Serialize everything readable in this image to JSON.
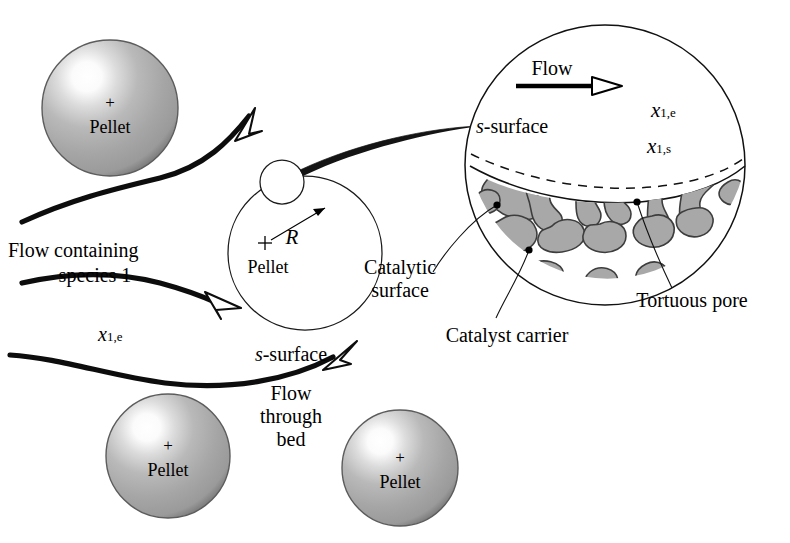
{
  "figure": {
    "type": "schematic-diagram",
    "background": "#ffffff",
    "ink_color": "#000000",
    "pellet_gray": "#a9a9a9",
    "pellet_dark_edge": "#6e6e6e",
    "pore_solid_gray": "#a8a8a8",
    "pore_outline": "#3a3a3a"
  },
  "pellets": [
    {
      "id": "pellet-top-left",
      "label": "Pellet",
      "center_mark": "+",
      "cx": 110,
      "cy": 108,
      "r": 68
    },
    {
      "id": "pellet-bottom-left",
      "label": "Pellet",
      "center_mark": "+",
      "cx": 168,
      "cy": 456,
      "r": 62
    },
    {
      "id": "pellet-bottom-right",
      "label": "Pellet",
      "center_mark": "+",
      "cx": 400,
      "cy": 468,
      "r": 58
    }
  ],
  "pellet_outline": {
    "id": "pellet-outline-center",
    "label": "Pellet",
    "center_mark": "+",
    "radius_label": "R",
    "cx": 305,
    "cy": 253,
    "r": 77
  },
  "labels": {
    "flow_containing": "Flow containing",
    "species_1": "species 1",
    "x1e_left": "x",
    "x1e_left_sub": "1,e",
    "s_surface_left": "s-surface",
    "flow_through": "Flow",
    "flow_through2": "through",
    "flow_through3": "bed"
  },
  "detail": {
    "id": "magnified-pellet-surface",
    "cx": 605,
    "cy": 165,
    "r": 140,
    "flow_label": "Flow",
    "x1e": {
      "base": "x",
      "sub": "1,e"
    },
    "x1s": {
      "base": "x",
      "sub": "1,s"
    },
    "s_surface": "s-surface",
    "callouts": [
      {
        "id": "catalytic-surface",
        "line1": "Catalytic",
        "line2": "surface"
      },
      {
        "id": "catalyst-carrier",
        "line1": "Catalyst carrier",
        "line2": ""
      },
      {
        "id": "tortuous-pore",
        "line1": "Tortuous pore",
        "line2": ""
      }
    ]
  }
}
